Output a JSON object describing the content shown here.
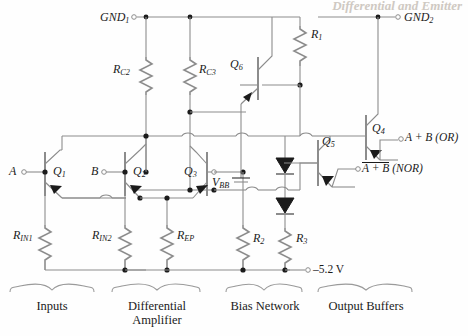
{
  "diagram": {
    "title_watermark": "Differential and Emitter",
    "type": "ecl-or-nor-gate-schematic",
    "supply_rail_label": "–5.2 V",
    "nodes": {
      "gnd1": "GND",
      "gnd1_sub": "1",
      "gnd2": "GND",
      "gnd2_sub": "2"
    },
    "inputs": [
      {
        "name": "input-a",
        "label": "A"
      },
      {
        "name": "input-b",
        "label": "B"
      },
      {
        "name": "bias-vbb",
        "label": "V",
        "sub": "BB"
      }
    ],
    "outputs": [
      {
        "name": "output-or",
        "label": "A + B (OR)",
        "overline": false
      },
      {
        "name": "output-nor",
        "label": "A + B",
        "suffix": " (NOR)",
        "overline": true
      }
    ],
    "transistors": [
      {
        "name": "transistor-q1",
        "label": "Q",
        "sub": "1"
      },
      {
        "name": "transistor-q2",
        "label": "Q",
        "sub": "2"
      },
      {
        "name": "transistor-q3",
        "label": "Q",
        "sub": "3"
      },
      {
        "name": "transistor-q4",
        "label": "Q",
        "sub": "4"
      },
      {
        "name": "transistor-q5",
        "label": "Q",
        "sub": "5"
      },
      {
        "name": "transistor-q6",
        "label": "Q",
        "sub": "6"
      }
    ],
    "resistors": [
      {
        "name": "resistor-rc2",
        "label": "R",
        "sub": "C2"
      },
      {
        "name": "resistor-rc3",
        "label": "R",
        "sub": "C3"
      },
      {
        "name": "resistor-r1",
        "label": "R",
        "sub": "1"
      },
      {
        "name": "resistor-rin1",
        "label": "R",
        "sub": "IN1"
      },
      {
        "name": "resistor-rin2",
        "label": "R",
        "sub": "IN2"
      },
      {
        "name": "resistor-rep",
        "label": "R",
        "sub": "EP"
      },
      {
        "name": "resistor-r2",
        "label": "R",
        "sub": "2"
      },
      {
        "name": "resistor-r3",
        "label": "R",
        "sub": "3"
      }
    ],
    "diodes": [
      {
        "name": "diode-d1"
      },
      {
        "name": "diode-d2"
      }
    ],
    "sections": [
      {
        "name": "section-inputs",
        "label": "Inputs"
      },
      {
        "name": "section-differential-amplifier",
        "label": "Differential\nAmplifier",
        "line1": "Differential",
        "line2": "Amplifier"
      },
      {
        "name": "section-bias-network",
        "label": "Bias Network"
      },
      {
        "name": "section-output-buffers",
        "label": "Output Buffers"
      }
    ],
    "colors": {
      "wire": "#8c8c8c",
      "ink": "#1b1b1b",
      "background": "#fefefe"
    }
  }
}
